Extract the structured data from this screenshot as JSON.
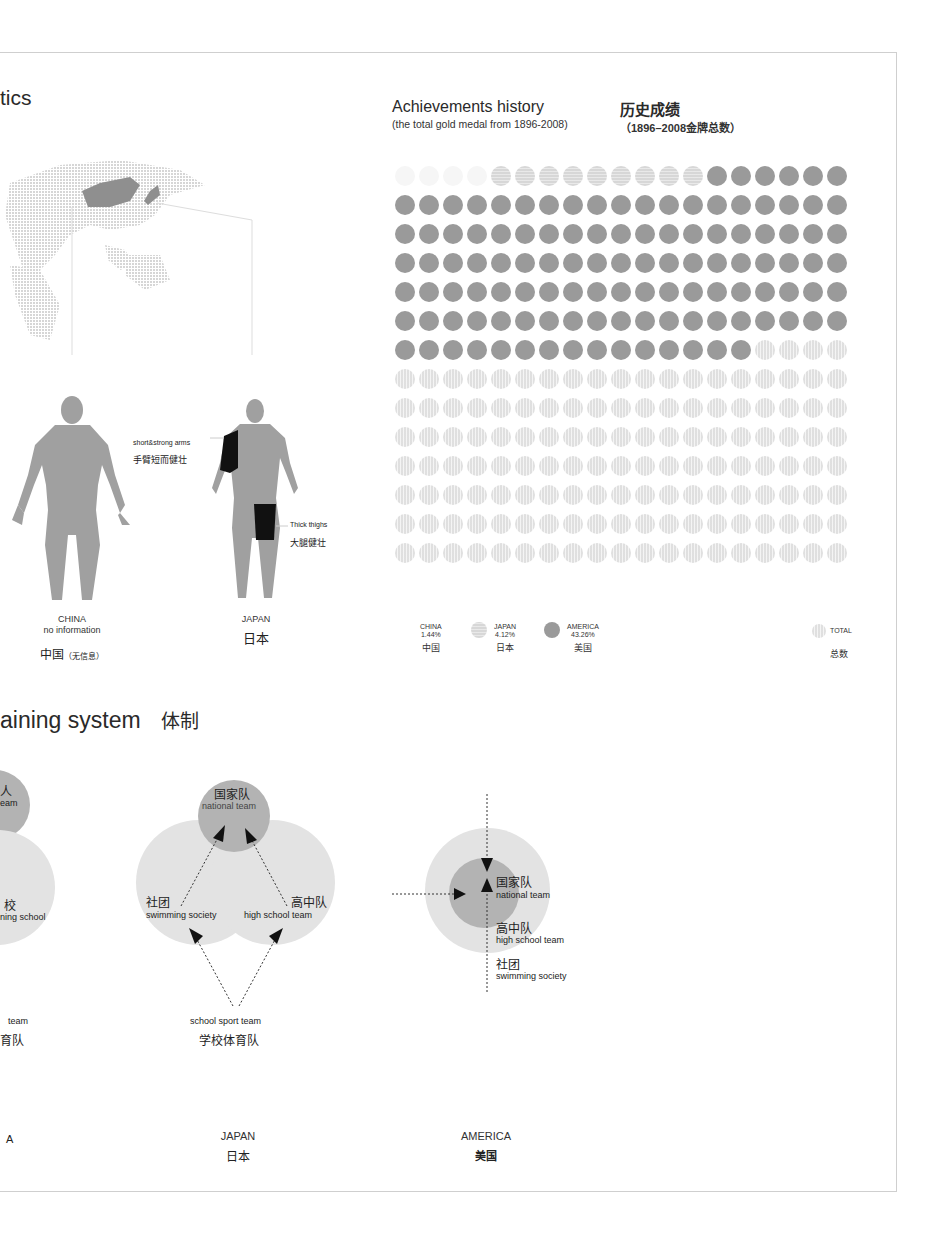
{
  "section1": {
    "title_partial": "tics"
  },
  "map": {
    "highlight": [
      "China",
      "Japan"
    ]
  },
  "physique": {
    "china": {
      "label_en": "CHINA",
      "note_en": "no information",
      "label_cn": "中国",
      "note_cn": "（无信息）"
    },
    "japan": {
      "label_en": "JAPAN",
      "label_cn": "日本",
      "annotations": [
        {
          "en": "short&strong arms",
          "cn": "手臂短而健壮"
        },
        {
          "en": "Thick thighs",
          "cn": "大腿健壮"
        }
      ]
    }
  },
  "achievements": {
    "title_en": "Achievements history",
    "subtitle_en": "(the total gold medal from 1896-2008)",
    "title_cn": "历史成绩",
    "subtitle_cn": "（1896–2008金牌总数）",
    "legend": [
      {
        "en": "CHINA",
        "pct": "1.44%",
        "cn": "中国"
      },
      {
        "en": "JAPAN",
        "pct": "4.12%",
        "cn": "日本"
      },
      {
        "en": "AMERICA",
        "pct": "43.26%",
        "cn": "美国"
      },
      {
        "en": "TOTAL",
        "pct": "",
        "cn": "总数"
      }
    ],
    "colors": {
      "america": "#9a9a9a",
      "japan": "#e6e6e6",
      "china": "#f6f6f6",
      "total": "#e8e8e8"
    }
  },
  "chart_data": {
    "type": "dot-matrix",
    "grid": {
      "rows": 14,
      "cols": 19,
      "total_dots": 266
    },
    "series": [
      {
        "name": "CHINA",
        "name_cn": "中国",
        "share_pct": 1.44,
        "dots": 4
      },
      {
        "name": "JAPAN",
        "name_cn": "日本",
        "share_pct": 4.12,
        "dots": 9
      },
      {
        "name": "AMERICA",
        "name_cn": "美国",
        "share_pct": 43.26,
        "dots": 116
      },
      {
        "name": "TOTAL",
        "name_cn": "总数",
        "share_pct": 100,
        "dots": 137
      }
    ],
    "fill_order": "row-major from top-left: china, japan, america, remaining total"
  },
  "training": {
    "title_partial": "aining system",
    "title_cn": "体制",
    "china_partial": {
      "national_cn": "人",
      "national_en": "eam",
      "school_cn": "校",
      "school_en": "ning school",
      "sport_en": "team",
      "sport_cn": "育队",
      "label_en": "A"
    },
    "japan": {
      "label_en": "JAPAN",
      "label_cn": "日本",
      "national_cn": "国家队",
      "national_en": "national team",
      "society_cn": "社团",
      "society_en": "swimming society",
      "highschool_cn": "高中队",
      "highschool_en": "high school team",
      "school_en": "school sport team",
      "school_cn": "学校体育队"
    },
    "america": {
      "label_en": "AMERICA",
      "label_cn": "美国",
      "national_cn": "国家队",
      "national_en": "national team",
      "highschool_cn": "高中队",
      "highschool_en": "high school team",
      "society_cn": "社团",
      "society_en": "swimming society"
    }
  }
}
